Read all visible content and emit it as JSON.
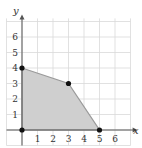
{
  "chart_data": {
    "type": "area",
    "title": "",
    "xlabel": "x",
    "ylabel": "y",
    "xlim": [
      0,
      7
    ],
    "ylim": [
      0,
      7
    ],
    "grid": true,
    "x_ticks": [
      "1",
      "2",
      "3",
      "4",
      "5",
      "6"
    ],
    "y_ticks": [
      "1",
      "2",
      "3",
      "4",
      "5",
      "6"
    ],
    "region": {
      "description": "Shaded feasible region polygon",
      "vertices": [
        [
          0,
          0
        ],
        [
          0,
          4
        ],
        [
          3,
          3
        ],
        [
          5,
          0
        ]
      ]
    },
    "points": [
      {
        "x": 0,
        "y": 0
      },
      {
        "x": 0,
        "y": 4
      },
      {
        "x": 3,
        "y": 3
      },
      {
        "x": 5,
        "y": 0
      }
    ]
  },
  "colors": {
    "grid": "#d9d9d9",
    "axis": "#555555",
    "fill": "#cfcfcf",
    "edge": "#9a9a9a",
    "point": "#111111"
  }
}
